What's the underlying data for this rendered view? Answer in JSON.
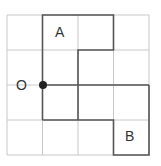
{
  "diagram": {
    "grid": {
      "rows": 4,
      "cols": 4
    },
    "labels": {
      "a": "A",
      "b": "B",
      "o": "O"
    },
    "colors": {
      "grid": "#c8c8c8",
      "path": "#555555",
      "dot": "#222222"
    }
  }
}
